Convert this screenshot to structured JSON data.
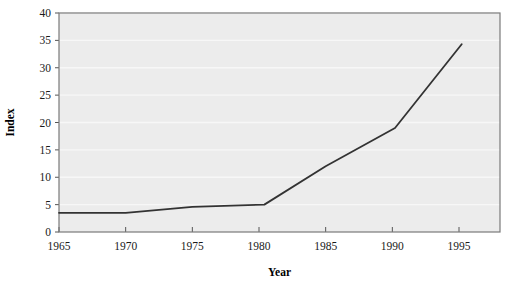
{
  "chart_data": {
    "type": "line",
    "title": "",
    "subtitle": "",
    "xlabel": "Year",
    "ylabel": "Index",
    "xlim": [
      1965,
      1995
    ],
    "ylim": [
      0,
      40
    ],
    "xticks": [
      1965,
      1970,
      1975,
      1980,
      1985,
      1990,
      1995
    ],
    "xtick_labels": [
      "1965",
      "1970",
      "1975",
      "1980",
      "1985",
      "1990",
      "1995"
    ],
    "yticks": [
      0,
      5,
      10,
      15,
      20,
      25,
      30,
      35,
      40
    ],
    "ytick_labels": [
      "0",
      "5",
      "10",
      "15",
      "20",
      "25",
      "30",
      "35",
      "40"
    ],
    "grid": "horizontal",
    "legend": "none",
    "annotations": [],
    "series": [
      {
        "name": "Index",
        "color": "#333333",
        "linewidth": 1.8,
        "x": [
          1965,
          1970,
          1975,
          1980.4,
          1985,
          1990.2,
          1995.2
        ],
        "values": [
          3.5,
          3.5,
          4.6,
          5.0,
          12.0,
          19.0,
          34.3
        ]
      }
    ]
  },
  "style": {
    "plot_background": "#ececec",
    "page_background": "#ffffff",
    "gridline_color": "#f7f7f7",
    "axis_color": "#555555",
    "border_color": "#7a7a7a",
    "line_color": "#333333",
    "tick_text_color": "#1a1a1a"
  },
  "axes": {
    "x_title": "Year",
    "y_title": "Index"
  }
}
